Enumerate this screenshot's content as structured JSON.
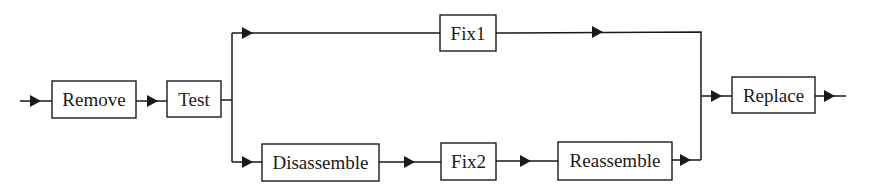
{
  "diagram": {
    "type": "flowchart",
    "nodes": [
      {
        "id": "remove",
        "label": "Remove",
        "x": 52,
        "y": 81,
        "w": 84,
        "h": 37
      },
      {
        "id": "test",
        "label": "Test",
        "x": 167,
        "y": 81,
        "w": 54,
        "h": 36
      },
      {
        "id": "fix1",
        "label": "Fix1",
        "x": 440,
        "y": 15,
        "w": 56,
        "h": 36
      },
      {
        "id": "disassemble",
        "label": "Disassemble",
        "x": 262,
        "y": 144,
        "w": 117,
        "h": 37
      },
      {
        "id": "fix2",
        "label": "Fix2",
        "x": 441,
        "y": 143,
        "w": 55,
        "h": 37
      },
      {
        "id": "reassemble",
        "label": "Reassemble",
        "x": 558,
        "y": 142,
        "w": 114,
        "h": 38
      },
      {
        "id": "replace",
        "label": "Replace",
        "x": 732,
        "y": 77,
        "w": 83,
        "h": 36
      }
    ],
    "edges": [
      {
        "from": "input",
        "to": "remove"
      },
      {
        "from": "remove",
        "to": "test"
      },
      {
        "from": "test",
        "to": "fix1",
        "branch": "top"
      },
      {
        "from": "test",
        "to": "disassemble",
        "branch": "bottom"
      },
      {
        "from": "disassemble",
        "to": "fix2"
      },
      {
        "from": "fix2",
        "to": "reassemble"
      },
      {
        "from": "fix1",
        "to": "replace"
      },
      {
        "from": "reassemble",
        "to": "replace"
      },
      {
        "from": "replace",
        "to": "output"
      }
    ],
    "colors": {
      "stroke": "#1a1a1a",
      "background": "#ffffff"
    }
  }
}
